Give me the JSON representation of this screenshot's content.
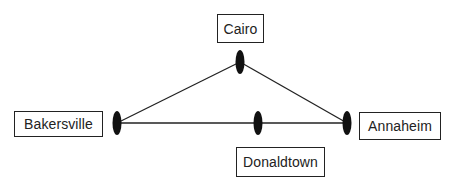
{
  "diagram": {
    "type": "network graph",
    "nodes": [
      {
        "id": "cairo",
        "label": "Cairo",
        "x": 240,
        "y": 62
      },
      {
        "id": "bakersville",
        "label": "Bakersville",
        "x": 117,
        "y": 123
      },
      {
        "id": "donaldtown",
        "label": "Donaldtown",
        "x": 258,
        "y": 123
      },
      {
        "id": "annaheim",
        "label": "Annaheim",
        "x": 347,
        "y": 123
      }
    ],
    "edges": [
      {
        "from": "bakersville",
        "to": "cairo"
      },
      {
        "from": "cairo",
        "to": "annaheim"
      },
      {
        "from": "bakersville",
        "to": "donaldtown"
      },
      {
        "from": "donaldtown",
        "to": "annaheim"
      }
    ],
    "colors": {
      "line": "#222222",
      "node": "#111111",
      "box_border": "#222222"
    }
  }
}
